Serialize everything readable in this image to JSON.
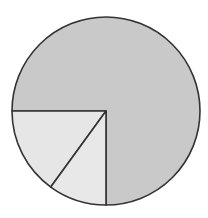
{
  "chart_data": {
    "type": "pie",
    "title": "",
    "title_note": "Title text clipped at top edge; not legible",
    "slices": [
      {
        "label": "",
        "value": 75,
        "color": "#c9c9c9"
      },
      {
        "label": "",
        "value": 15,
        "color": "#e6e6e6"
      },
      {
        "label": "",
        "value": 10,
        "color": "#e8e8e8"
      }
    ],
    "stroke_color": "#333333",
    "start_angle_deg": 270,
    "legend": "none"
  }
}
